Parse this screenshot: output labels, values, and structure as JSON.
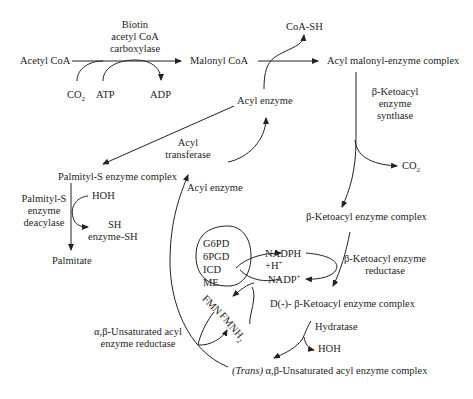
{
  "diagram": {
    "nodes": {
      "acetyl_coa": "Acetyl CoA",
      "malonyl_coa": "Malonyl CoA",
      "coa_sh": "CoA-SH",
      "acyl_malonyl_complex": "Acyl malonyl-enzyme complex",
      "acyl_enzyme_top": "Acyl enzyme",
      "acyl_enzyme_mid": "Acyl enzyme",
      "palmityl_s_complex": "Palmityl-S enzyme complex",
      "palmitate": "Palmitate",
      "beta_ketoacyl_complex": "β-Ketoacyl enzyme complex",
      "d_beta_ketoacyl_complex": "D(-)- β-Ketoacyl enzyme complex",
      "trans_prefix": "(Trans)",
      "trans_unsaturated_complex": " α,β-Unsaturated acyl enzyme complex"
    },
    "enzymes": {
      "carboxylase_line1": "Biotin",
      "carboxylase_line2": "acetyl CoA",
      "carboxylase_line3": "carboxylase",
      "synthase_line1": "β-Ketoacyl",
      "synthase_line2": "enzyme",
      "synthase_line3": "synthase",
      "transferase_line1": "Acyl",
      "transferase_line2": "transferase",
      "deacylase_line1": "Palmityl-S",
      "deacylase_line2": "enzyme",
      "deacylase_line3": "deacylase",
      "reductase_line1": "β-Ketoacyl enzyme",
      "reductase_line2": "reductase",
      "hydratase": "Hydratase",
      "unsat_reductase_line1": "α,β-Unsaturated acyl",
      "unsat_reductase_line2": "enzyme reductase"
    },
    "cofactors": {
      "co2_left": "CO",
      "co2_left_sub": "2",
      "atp": "ATP",
      "adp": "ADP",
      "co2_right": "CO",
      "co2_right_sub": "2",
      "hoh_deacylase": "HOH",
      "sh": "SH",
      "enzyme_sh": "enzyme-SH",
      "nadph": "NADPH",
      "h_plus": "+H",
      "h_plus_sup": "+",
      "nadp": "NADP",
      "nadp_sup": "+",
      "fmn": "FMN",
      "fmnh2": "FMNH",
      "fmnh2_sub": "2",
      "hoh_hydratase": "HOH"
    },
    "nadph_sources": [
      "G6PD",
      "6PGD",
      "ICD",
      "ME"
    ]
  }
}
